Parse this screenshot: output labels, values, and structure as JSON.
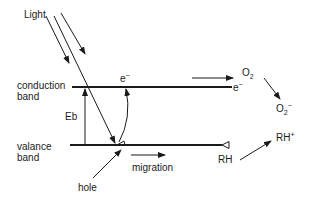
{
  "labels": {
    "light": "Light",
    "conduction_band_1": "conduction",
    "conduction_band_2": "band",
    "valence_band_1": "valance",
    "valence_band_2": "band",
    "eb": "Eb",
    "electron_cb": "e",
    "electron_cb_sup": "−",
    "electron_right": "e",
    "electron_right_sup": "−",
    "o2": "O",
    "o2_sub": "2",
    "superoxide": "O",
    "superoxide_sub": "2",
    "superoxide_sup": "−",
    "hole": "hole",
    "migration": "migration",
    "rh": "RH",
    "rh_plus": "RH",
    "rh_plus_sup": "+"
  },
  "colors": {
    "line": "#1a1a1a",
    "background": "#ffffff"
  }
}
